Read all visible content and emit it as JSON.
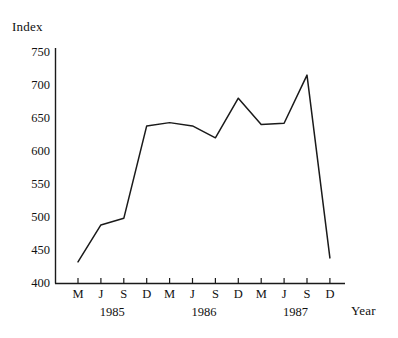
{
  "chart_data": {
    "type": "line",
    "title": "",
    "ylabel": "Index",
    "xlabel": "Year",
    "grid": false,
    "legend": null,
    "ylim": [
      400,
      750
    ],
    "ytick_values": [
      750,
      700,
      650,
      600,
      550,
      500,
      450,
      400
    ],
    "ytick_labels": [
      "750",
      "700",
      "650",
      "600",
      "550",
      "500",
      "450",
      "400"
    ],
    "categories": [
      "M",
      "J",
      "S",
      "D",
      "M",
      "J",
      "S",
      "D",
      "M",
      "J",
      "S",
      "D"
    ],
    "x_group_labels": [
      "1985",
      "1986",
      "1987"
    ],
    "values": [
      432,
      488,
      498,
      638,
      643,
      638,
      620,
      680,
      640,
      642,
      715,
      438
    ],
    "series": [
      {
        "name": "Index",
        "values": [
          432,
          488,
          498,
          638,
          643,
          638,
          620,
          680,
          640,
          642,
          715,
          438
        ]
      }
    ],
    "line_color": "#1a1a1a",
    "axis_color": "#1a1a1a"
  }
}
